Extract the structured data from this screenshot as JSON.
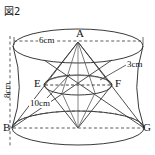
{
  "figure": {
    "caption": "図2",
    "kind": "solid-geometry-diagram",
    "stroke_color": "#3a3a3a",
    "dash_color": "#4a4a4a",
    "background": "#ffffff"
  },
  "points": [
    {
      "id": "A",
      "label": "A",
      "x": 78,
      "y": 32,
      "role": "apex-top"
    },
    {
      "id": "E",
      "label": "E",
      "x": 36,
      "y": 80,
      "role": "middle-left"
    },
    {
      "id": "F",
      "label": "F",
      "x": 116,
      "y": 80,
      "role": "middle-right"
    },
    {
      "id": "B",
      "label": "B",
      "x": 4,
      "y": 122,
      "role": "base-left"
    },
    {
      "id": "G",
      "label": "G",
      "x": 143,
      "y": 122,
      "role": "base-right"
    }
  ],
  "dimensions": [
    {
      "id": "top-diameter",
      "label": "6cm",
      "x": 36,
      "y": 32,
      "orientation": "horizontal"
    },
    {
      "id": "mid-radius",
      "label": "3cm",
      "x": 127,
      "y": 60,
      "orientation": "horizontal"
    },
    {
      "id": "height",
      "label": "8cm",
      "x": 3,
      "y": 92,
      "orientation": "vertical"
    },
    {
      "id": "slant",
      "label": "10cm",
      "x": 29,
      "y": 99,
      "orientation": "horizontal"
    }
  ]
}
